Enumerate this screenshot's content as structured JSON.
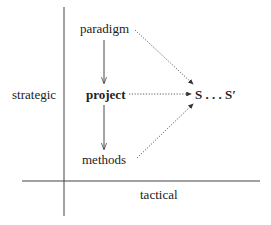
{
  "diagram": {
    "axes": {
      "vertical_label": "strategic",
      "horizontal_label": "tactical"
    },
    "nodes": {
      "paradigm": "paradigm",
      "project": "project",
      "methods": "methods",
      "target": "S . . . S′"
    },
    "edges": [
      {
        "from": "paradigm",
        "to": "project",
        "style": "solid"
      },
      {
        "from": "project",
        "to": "methods",
        "style": "solid"
      },
      {
        "from": "paradigm",
        "to": "target",
        "style": "dotted"
      },
      {
        "from": "project",
        "to": "target",
        "style": "dotted"
      },
      {
        "from": "methods",
        "to": "target",
        "style": "dotted"
      }
    ],
    "colors": {
      "line": "#333333",
      "background": "#ffffff"
    }
  }
}
